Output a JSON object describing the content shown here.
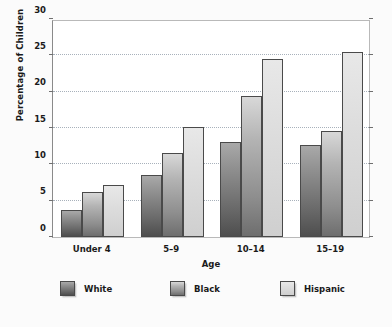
{
  "chart_data": {
    "type": "bar",
    "title": "",
    "xlabel": "Age",
    "ylabel": "Percentage of Children",
    "categories": [
      "Under 4",
      "5–9",
      "10–14",
      "15–19"
    ],
    "series": [
      {
        "name": "White",
        "values": [
          3.7,
          8.5,
          13.1,
          12.7
        ],
        "color": "#6a6a6a"
      },
      {
        "name": "Black",
        "values": [
          6.2,
          11.5,
          19.4,
          14.6
        ],
        "color": "#9a9a9a"
      },
      {
        "name": "Hispanic",
        "values": [
          7.1,
          15.1,
          24.5,
          25.4
        ],
        "color": "#dcdcdc"
      }
    ],
    "ylim": [
      0,
      30
    ],
    "yticks": [
      0,
      5,
      10,
      15,
      20,
      25,
      30
    ],
    "ytick_labels": [
      "0",
      "5",
      "10",
      "15",
      "20",
      "25",
      "30"
    ],
    "grid": true,
    "grid_axis": "y",
    "legend_position": "bottom",
    "bar_gradient": true
  },
  "axes": {
    "y_title": "Percentage of Children",
    "x_title": "Age"
  },
  "legend": {
    "items": [
      {
        "label": "White"
      },
      {
        "label": "Black"
      },
      {
        "label": "Hispanic"
      }
    ]
  },
  "colors": {
    "background": "#fbfbfb",
    "plot_background": "#ffffff",
    "frame": "#b9b9b9",
    "axis": "#8a8a8a",
    "gridline": "#9aa4b0",
    "text": "#1a1a1a",
    "bar_white": "#6a6a6a",
    "bar_black": "#9a9a9a",
    "bar_hispanic": "#dcdcdc"
  }
}
